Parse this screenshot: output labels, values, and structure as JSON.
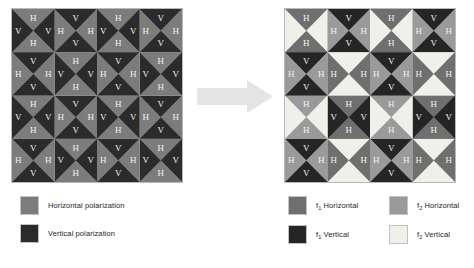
{
  "figure": {
    "caption": "",
    "arrow_icon": "right-arrow-icon",
    "arrow_color": "#e2e2e2"
  },
  "palette": {
    "horizontal": "#7c7c7c",
    "vertical": "#2b2b2b",
    "f1_horizontal": "#6f6f6f",
    "f2_horizontal": "#9a9a9a",
    "f1_vertical": "#252525",
    "f2_vertical": "#f0efe9",
    "label_color": "#f2f2f2",
    "grid_border": "#b9b9b9"
  },
  "grids": {
    "left": {
      "name": "polarization-grid",
      "rows": 4,
      "cols": 4,
      "cells": [
        [
          {
            "top": {
              "label": "H",
              "fill": "horizontal"
            },
            "right": {
              "label": "V",
              "fill": "vertical"
            },
            "bottom": {
              "label": "H",
              "fill": "horizontal"
            },
            "left": {
              "label": "V",
              "fill": "vertical"
            }
          },
          {
            "top": {
              "label": "V",
              "fill": "vertical"
            },
            "right": {
              "label": "H",
              "fill": "horizontal"
            },
            "bottom": {
              "label": "V",
              "fill": "vertical"
            },
            "left": {
              "label": "H",
              "fill": "horizontal"
            }
          },
          {
            "top": {
              "label": "H",
              "fill": "horizontal"
            },
            "right": {
              "label": "V",
              "fill": "vertical"
            },
            "bottom": {
              "label": "H",
              "fill": "horizontal"
            },
            "left": {
              "label": "V",
              "fill": "vertical"
            }
          },
          {
            "top": {
              "label": "V",
              "fill": "vertical"
            },
            "right": {
              "label": "H",
              "fill": "horizontal"
            },
            "bottom": {
              "label": "V",
              "fill": "vertical"
            },
            "left": {
              "label": "H",
              "fill": "horizontal"
            }
          }
        ],
        [
          {
            "top": {
              "label": "V",
              "fill": "vertical"
            },
            "right": {
              "label": "H",
              "fill": "horizontal"
            },
            "bottom": {
              "label": "V",
              "fill": "vertical"
            },
            "left": {
              "label": "H",
              "fill": "horizontal"
            }
          },
          {
            "top": {
              "label": "H",
              "fill": "horizontal"
            },
            "right": {
              "label": "V",
              "fill": "vertical"
            },
            "bottom": {
              "label": "H",
              "fill": "horizontal"
            },
            "left": {
              "label": "V",
              "fill": "vertical"
            }
          },
          {
            "top": {
              "label": "V",
              "fill": "vertical"
            },
            "right": {
              "label": "H",
              "fill": "horizontal"
            },
            "bottom": {
              "label": "V",
              "fill": "vertical"
            },
            "left": {
              "label": "H",
              "fill": "horizontal"
            }
          },
          {
            "top": {
              "label": "H",
              "fill": "horizontal"
            },
            "right": {
              "label": "V",
              "fill": "vertical"
            },
            "bottom": {
              "label": "H",
              "fill": "horizontal"
            },
            "left": {
              "label": "V",
              "fill": "vertical"
            }
          }
        ],
        [
          {
            "top": {
              "label": "H",
              "fill": "horizontal"
            },
            "right": {
              "label": "V",
              "fill": "vertical"
            },
            "bottom": {
              "label": "H",
              "fill": "horizontal"
            },
            "left": {
              "label": "V",
              "fill": "vertical"
            }
          },
          {
            "top": {
              "label": "V",
              "fill": "vertical"
            },
            "right": {
              "label": "H",
              "fill": "horizontal"
            },
            "bottom": {
              "label": "V",
              "fill": "vertical"
            },
            "left": {
              "label": "H",
              "fill": "horizontal"
            }
          },
          {
            "top": {
              "label": "H",
              "fill": "horizontal"
            },
            "right": {
              "label": "V",
              "fill": "vertical"
            },
            "bottom": {
              "label": "H",
              "fill": "horizontal"
            },
            "left": {
              "label": "V",
              "fill": "vertical"
            }
          },
          {
            "top": {
              "label": "V",
              "fill": "vertical"
            },
            "right": {
              "label": "H",
              "fill": "horizontal"
            },
            "bottom": {
              "label": "V",
              "fill": "vertical"
            },
            "left": {
              "label": "H",
              "fill": "horizontal"
            }
          }
        ],
        [
          {
            "top": {
              "label": "V",
              "fill": "vertical"
            },
            "right": {
              "label": "H",
              "fill": "horizontal"
            },
            "bottom": {
              "label": "V",
              "fill": "vertical"
            },
            "left": {
              "label": "H",
              "fill": "horizontal"
            }
          },
          {
            "top": {
              "label": "H",
              "fill": "horizontal"
            },
            "right": {
              "label": "V",
              "fill": "vertical"
            },
            "bottom": {
              "label": "H",
              "fill": "horizontal"
            },
            "left": {
              "label": "V",
              "fill": "vertical"
            }
          },
          {
            "top": {
              "label": "V",
              "fill": "vertical"
            },
            "right": {
              "label": "H",
              "fill": "horizontal"
            },
            "bottom": {
              "label": "V",
              "fill": "vertical"
            },
            "left": {
              "label": "H",
              "fill": "horizontal"
            }
          },
          {
            "top": {
              "label": "H",
              "fill": "horizontal"
            },
            "right": {
              "label": "V",
              "fill": "vertical"
            },
            "bottom": {
              "label": "H",
              "fill": "horizontal"
            },
            "left": {
              "label": "V",
              "fill": "vertical"
            }
          }
        ]
      ]
    },
    "right": {
      "name": "frequency-polarization-grid",
      "rows": 4,
      "cols": 4,
      "cells": [
        [
          {
            "top": {
              "label": "H",
              "fill": "f1_horizontal"
            },
            "right": {
              "label": "V",
              "fill": "f2_vertical"
            },
            "bottom": {
              "label": "H",
              "fill": "f1_horizontal"
            },
            "left": {
              "label": "V",
              "fill": "f2_vertical"
            }
          },
          {
            "top": {
              "label": "V",
              "fill": "f1_vertical"
            },
            "right": {
              "label": "H",
              "fill": "f2_horizontal"
            },
            "bottom": {
              "label": "V",
              "fill": "f1_vertical"
            },
            "left": {
              "label": "H",
              "fill": "f2_horizontal"
            }
          },
          {
            "top": {
              "label": "H",
              "fill": "f1_horizontal"
            },
            "right": {
              "label": "V",
              "fill": "f2_vertical"
            },
            "bottom": {
              "label": "H",
              "fill": "f1_horizontal"
            },
            "left": {
              "label": "V",
              "fill": "f2_vertical"
            }
          },
          {
            "top": {
              "label": "V",
              "fill": "f1_vertical"
            },
            "right": {
              "label": "H",
              "fill": "f2_horizontal"
            },
            "bottom": {
              "label": "V",
              "fill": "f1_vertical"
            },
            "left": {
              "label": "H",
              "fill": "f2_horizontal"
            }
          }
        ],
        [
          {
            "top": {
              "label": "V",
              "fill": "f1_vertical"
            },
            "right": {
              "label": "H",
              "fill": "f2_horizontal"
            },
            "bottom": {
              "label": "V",
              "fill": "f1_vertical"
            },
            "left": {
              "label": "H",
              "fill": "f2_horizontal"
            }
          },
          {
            "top": {
              "label": "V",
              "fill": "f2_vertical"
            },
            "right": {
              "label": "H",
              "fill": "f1_horizontal"
            },
            "bottom": {
              "label": "V",
              "fill": "f2_vertical"
            },
            "left": {
              "label": "H",
              "fill": "f1_horizontal"
            }
          },
          {
            "top": {
              "label": "V",
              "fill": "f1_vertical"
            },
            "right": {
              "label": "H",
              "fill": "f2_horizontal"
            },
            "bottom": {
              "label": "V",
              "fill": "f1_vertical"
            },
            "left": {
              "label": "H",
              "fill": "f2_horizontal"
            }
          },
          {
            "top": {
              "label": "V",
              "fill": "f2_vertical"
            },
            "right": {
              "label": "H",
              "fill": "f1_horizontal"
            },
            "bottom": {
              "label": "V",
              "fill": "f2_vertical"
            },
            "left": {
              "label": "H",
              "fill": "f1_horizontal"
            }
          }
        ],
        [
          {
            "top": {
              "label": "H",
              "fill": "f2_horizontal"
            },
            "right": {
              "label": "V",
              "fill": "f2_vertical"
            },
            "bottom": {
              "label": "H",
              "fill": "f2_horizontal"
            },
            "left": {
              "label": "V",
              "fill": "f2_vertical"
            }
          },
          {
            "top": {
              "label": "H",
              "fill": "f1_horizontal"
            },
            "right": {
              "label": "V",
              "fill": "f1_vertical"
            },
            "bottom": {
              "label": "H",
              "fill": "f1_horizontal"
            },
            "left": {
              "label": "V",
              "fill": "f1_vertical"
            }
          },
          {
            "top": {
              "label": "H",
              "fill": "f2_horizontal"
            },
            "right": {
              "label": "V",
              "fill": "f2_vertical"
            },
            "bottom": {
              "label": "H",
              "fill": "f2_horizontal"
            },
            "left": {
              "label": "V",
              "fill": "f2_vertical"
            }
          },
          {
            "top": {
              "label": "H",
              "fill": "f1_horizontal"
            },
            "right": {
              "label": "V",
              "fill": "f1_vertical"
            },
            "bottom": {
              "label": "H",
              "fill": "f1_horizontal"
            },
            "left": {
              "label": "V",
              "fill": "f1_vertical"
            }
          }
        ],
        [
          {
            "top": {
              "label": "V",
              "fill": "f1_vertical"
            },
            "right": {
              "label": "H",
              "fill": "f2_horizontal"
            },
            "bottom": {
              "label": "V",
              "fill": "f1_vertical"
            },
            "left": {
              "label": "H",
              "fill": "f2_horizontal"
            }
          },
          {
            "top": {
              "label": "V",
              "fill": "f2_vertical"
            },
            "right": {
              "label": "H",
              "fill": "f1_horizontal"
            },
            "bottom": {
              "label": "V",
              "fill": "f2_vertical"
            },
            "left": {
              "label": "H",
              "fill": "f1_horizontal"
            }
          },
          {
            "top": {
              "label": "V",
              "fill": "f1_vertical"
            },
            "right": {
              "label": "H",
              "fill": "f2_horizontal"
            },
            "bottom": {
              "label": "V",
              "fill": "f1_vertical"
            },
            "left": {
              "label": "H",
              "fill": "f2_horizontal"
            }
          },
          {
            "top": {
              "label": "V",
              "fill": "f2_vertical"
            },
            "right": {
              "label": "H",
              "fill": "f1_horizontal"
            },
            "bottom": {
              "label": "V",
              "fill": "f2_vertical"
            },
            "left": {
              "label": "H",
              "fill": "f1_horizontal"
            }
          }
        ]
      ]
    }
  },
  "legend_left": {
    "name": "polarization-legend",
    "items": [
      {
        "label": "Horizontal polarization",
        "fill": "horizontal",
        "sub": ""
      },
      {
        "label": "Vertical polarization",
        "fill": "vertical",
        "sub": ""
      }
    ]
  },
  "legend_right": {
    "name": "frequency-polarization-legend",
    "items": [
      {
        "prefix": "f",
        "sub": "1",
        "label": " Horizontal",
        "fill": "f1_horizontal"
      },
      {
        "prefix": "f",
        "sub": "2",
        "label": " Horizontal",
        "fill": "f2_horizontal"
      },
      {
        "prefix": "f",
        "sub": "1",
        "label": " Vertical",
        "fill": "f1_vertical"
      },
      {
        "prefix": "f",
        "sub": "2",
        "label": " Vertical",
        "fill": "f2_vertical"
      }
    ]
  }
}
